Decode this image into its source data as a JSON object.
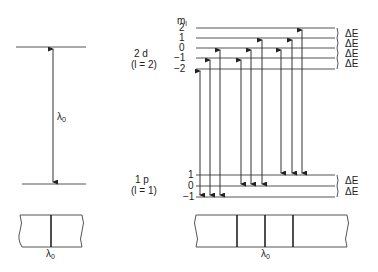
{
  "left_panel": {
    "transition_label": "λ",
    "transition_sub": "0",
    "spectrum_label": "λ",
    "spectrum_sub": "0"
  },
  "right_panel": {
    "ml_header": "m",
    "ml_header_sub": "l",
    "upper_state": {
      "name": "2 d",
      "quantum": "(l = 2)",
      "ml_levels": [
        "2",
        "1",
        "0",
        "−1",
        "−2"
      ]
    },
    "lower_state": {
      "name": "1 p",
      "quantum": "(l = 1)",
      "ml_levels": [
        "1",
        "0",
        "−1"
      ]
    },
    "spacing_labels": [
      "ΔE",
      "ΔE",
      "ΔE",
      "ΔE"
    ],
    "lower_spacing_labels": [
      "ΔE",
      "ΔE"
    ],
    "spectrum_label": "λ",
    "spectrum_sub": "0"
  },
  "geometry": {
    "upper_levels_y": [
      28,
      38,
      48,
      58,
      69
    ],
    "lower_levels_y": [
      175,
      186,
      197
    ],
    "transitions": [
      {
        "x": 200,
        "from": 197,
        "to": 69
      },
      {
        "x": 210,
        "from": 197,
        "to": 58
      },
      {
        "x": 220,
        "from": 197,
        "to": 48
      },
      {
        "x": 241,
        "from": 186,
        "to": 58
      },
      {
        "x": 251,
        "from": 186,
        "to": 48
      },
      {
        "x": 262,
        "from": 186,
        "to": 38
      },
      {
        "x": 281,
        "from": 175,
        "to": 48
      },
      {
        "x": 292,
        "from": 175,
        "to": 38
      },
      {
        "x": 302,
        "from": 175,
        "to": 28
      }
    ],
    "spectrum_lines_x": [
      237,
      265,
      293
    ]
  }
}
